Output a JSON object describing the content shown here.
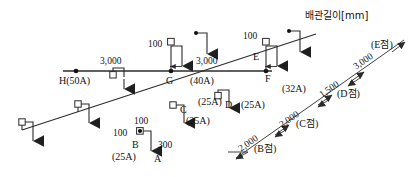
{
  "title": "배관길이[mm]",
  "units": "mm",
  "colors": {
    "line": "#2b2b2b",
    "text": "#111111",
    "background": "#ffffff"
  },
  "diagram": {
    "type": "piping-isometric-dimension-drawing",
    "main_run_label": "3,000",
    "horizontal_dimensions": [
      {
        "name": "H-to-G",
        "value": "3,000"
      },
      {
        "name": "G-to-F",
        "value": "3,000"
      }
    ],
    "nodes": [
      {
        "id": "H",
        "label": "H(50A)",
        "size": "50A"
      },
      {
        "id": "G",
        "label": "G",
        "size": "(40A)"
      },
      {
        "id": "F",
        "label": "F",
        "size": "(32A)"
      },
      {
        "id": "E",
        "label": "E",
        "size": ""
      },
      {
        "id": "D",
        "label": "D",
        "size": "(25A)"
      },
      {
        "id": "C",
        "label": "C",
        "size": "(25A)"
      },
      {
        "id": "B",
        "label": "B",
        "size": "(25A)"
      },
      {
        "id": "A",
        "label": "A",
        "size": ""
      }
    ],
    "branch_offsets": [
      {
        "near": "G",
        "value": "100"
      },
      {
        "near": "E",
        "value": "100"
      },
      {
        "near": "B-top",
        "value": "100"
      },
      {
        "near": "B-left",
        "value": "100"
      }
    ],
    "riser_dimension": {
      "label": "300",
      "near": "A"
    },
    "diagonal_dimensions": [
      {
        "value": "2,000",
        "point": "(B점)"
      },
      {
        "value": "2,000",
        "point": "(C점)"
      },
      {
        "value": "1,500",
        "point": "(D점)"
      },
      {
        "value": "3,000",
        "point": "(E점)"
      }
    ],
    "pipe_sizes_shown": [
      "50A",
      "40A",
      "32A",
      "25A"
    ],
    "size_labels": [
      {
        "text": "(40A)"
      },
      {
        "text": "(32A)"
      },
      {
        "text": "(25A)"
      },
      {
        "text": "(25A)"
      },
      {
        "text": "(25A)"
      }
    ]
  }
}
